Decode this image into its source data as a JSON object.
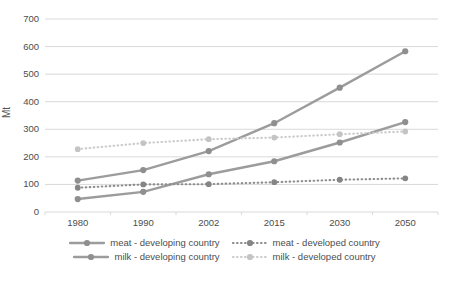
{
  "chart_data": {
    "type": "line",
    "title": "",
    "xlabel": "",
    "ylabel": "Mt",
    "ylim": [
      0,
      700
    ],
    "yticks": [
      0,
      100,
      200,
      300,
      400,
      500,
      600,
      700
    ],
    "categories": [
      "1980",
      "1990",
      "2002",
      "2015",
      "2030",
      "2050"
    ],
    "grid": true,
    "legend_position": "bottom",
    "grid_color": "#d9d9d9",
    "tick_text_color": "#4d4d4d",
    "series": [
      {
        "name": "meat - developing country",
        "style": "solid",
        "color": "#9c9c9c",
        "marker_color": "#8f8f8f",
        "values": [
          47,
          73,
          137,
          184,
          252,
          326
        ]
      },
      {
        "name": "meat - developed country",
        "style": "dotted",
        "color": "#8d8d8d",
        "marker_color": "#858585",
        "values": [
          88,
          100,
          101,
          108,
          117,
          122
        ]
      },
      {
        "name": "milk - developing country",
        "style": "solid",
        "color": "#9c9c9c",
        "marker_color": "#8f8f8f",
        "values": [
          114,
          152,
          221,
          322,
          451,
          583
        ]
      },
      {
        "name": "milk - developed country",
        "style": "dotted",
        "color": "#cbcbcb",
        "marker_color": "#c4c4c4",
        "values": [
          228,
          250,
          264,
          270,
          282,
          292
        ]
      }
    ]
  }
}
